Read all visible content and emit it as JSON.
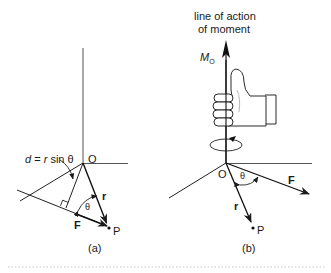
{
  "figure": {
    "panel_a": {
      "caption": "(a)",
      "distance_label": "d = r sin θ",
      "distance_label_parts": {
        "d": "d",
        "eq": " = ",
        "r": "r",
        "sin": " sin ",
        "theta": "θ"
      },
      "origin_label": "O",
      "point_label": "P",
      "position_vector_label": "r",
      "force_label": "F",
      "angle_label": "θ"
    },
    "panel_b": {
      "caption": "(b)",
      "axis_title_line1": "line of action",
      "axis_title_line2": "of moment",
      "moment_label": "M",
      "moment_subscript": "O",
      "origin_label": "O",
      "point_label": "P",
      "position_vector_label": "r",
      "force_label": "F",
      "angle_label": "θ"
    },
    "colors": {
      "line": "#1a1a1a",
      "axis_line": "#555555",
      "hand_outline": "#2a2a2a",
      "separator": "#c8c8c8"
    }
  }
}
